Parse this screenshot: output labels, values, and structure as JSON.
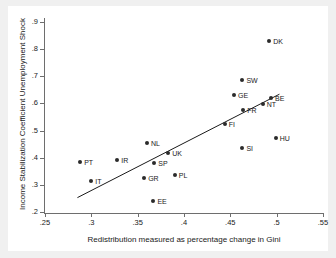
{
  "chart_data": {
    "type": "scatter",
    "title": "",
    "xlabel": "Redistribution measured as percentage change in Gini",
    "ylabel": "Income Stabilization Coefficient Unemployment Shock",
    "xlim": [
      0.25,
      0.55
    ],
    "ylim": [
      0.2,
      0.9
    ],
    "xticks": [
      0.25,
      0.3,
      0.35,
      0.4,
      0.45,
      0.5,
      0.55
    ],
    "xtick_labels": [
      ".25",
      ".3",
      ".35",
      ".4",
      ".45",
      ".5",
      ".55"
    ],
    "yticks": [
      0.2,
      0.3,
      0.4,
      0.5,
      0.6,
      0.7,
      0.8,
      0.9
    ],
    "ytick_labels": [
      ".2",
      ".3",
      ".4",
      ".5",
      ".6",
      ".7",
      ".8",
      ".9"
    ],
    "grid": false,
    "legend": "none",
    "marker_color": "#2b2b2b",
    "line_color": "#1a1a1a",
    "points": [
      {
        "label": "PT",
        "x": 0.288,
        "y": 0.385
      },
      {
        "label": "IT",
        "x": 0.3,
        "y": 0.315
      },
      {
        "label": "IR",
        "x": 0.328,
        "y": 0.39
      },
      {
        "label": "GR",
        "x": 0.357,
        "y": 0.325
      },
      {
        "label": "NL",
        "x": 0.36,
        "y": 0.455
      },
      {
        "label": "EE",
        "x": 0.367,
        "y": 0.24
      },
      {
        "label": "SP",
        "x": 0.368,
        "y": 0.38
      },
      {
        "label": "UK",
        "x": 0.383,
        "y": 0.417
      },
      {
        "label": "PL",
        "x": 0.39,
        "y": 0.335
      },
      {
        "label": "FI",
        "x": 0.444,
        "y": 0.523
      },
      {
        "label": "GE",
        "x": 0.454,
        "y": 0.63
      },
      {
        "label": "SW",
        "x": 0.463,
        "y": 0.685
      },
      {
        "label": "FR",
        "x": 0.464,
        "y": 0.577
      },
      {
        "label": "SI",
        "x": 0.463,
        "y": 0.437
      },
      {
        "label": "NT",
        "x": 0.485,
        "y": 0.597
      },
      {
        "label": "DK",
        "x": 0.492,
        "y": 0.83
      },
      {
        "label": "BE",
        "x": 0.494,
        "y": 0.62
      },
      {
        "label": "HU",
        "x": 0.499,
        "y": 0.472
      }
    ],
    "fit_line": {
      "x0": 0.285,
      "y0": 0.253,
      "x1": 0.503,
      "y1": 0.634
    }
  }
}
